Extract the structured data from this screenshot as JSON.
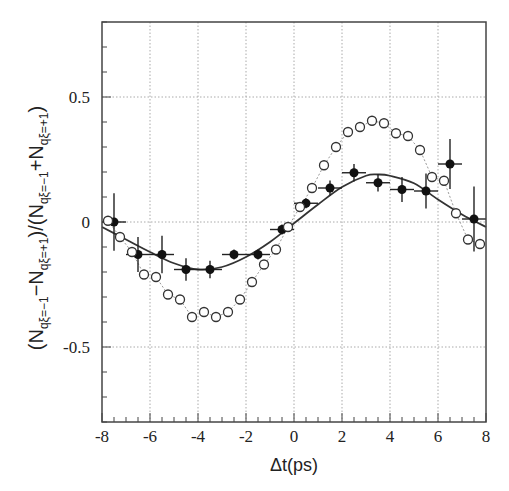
{
  "chart_data": {
    "type": "scatter",
    "title": "",
    "xlabel": "Δt(ps)",
    "ylabel": {
      "text": "(N_{qξ=−1} − N_{qξ=+1})/(N_{qξ=−1} + N_{qξ=+1})",
      "parts": [
        "(N",
        "qξ=−1",
        "−N",
        "qξ=+1",
        ")/(N",
        "qξ=−1",
        "+N",
        "qξ=+1",
        ")"
      ]
    },
    "xlim": [
      -8,
      8
    ],
    "ylim": [
      -0.8,
      0.8
    ],
    "xticks": [
      -8,
      -6,
      -4,
      -2,
      0,
      2,
      4,
      6,
      8
    ],
    "xtick_labels": [
      "-8",
      "-6",
      "-4",
      "-2",
      "0",
      "2",
      "4",
      "6",
      "8"
    ],
    "yticks": [
      -0.5,
      0,
      0.5
    ],
    "ytick_labels": [
      "-0.5",
      "0",
      "0.5"
    ],
    "grid": {
      "x": [
        -6,
        -4,
        -2,
        0,
        2,
        4,
        6
      ],
      "y": [
        -0.5,
        0,
        0.5
      ],
      "style": "dotted"
    },
    "legend": null,
    "series": [
      {
        "name": "data (filled)",
        "marker": "filled-circle",
        "color": "#111111",
        "x": [
          -7.5,
          -6.5,
          -5.5,
          -4.5,
          -3.5,
          -2.5,
          -1.5,
          -0.5,
          0.5,
          1.5,
          2.5,
          3.5,
          4.5,
          5.5,
          6.5,
          7.5
        ],
        "y": [
          0.0,
          -0.13,
          -0.13,
          -0.19,
          -0.19,
          -0.13,
          -0.13,
          -0.03,
          0.075,
          0.136,
          0.197,
          0.157,
          0.13,
          0.124,
          0.232,
          0.012
        ],
        "xerr": 0.5,
        "yerr": [
          0.115,
          0.07,
          0.075,
          0.045,
          0.035,
          0.02,
          0.02,
          0.02,
          0.02,
          0.03,
          0.035,
          0.035,
          0.05,
          0.07,
          0.1,
          0.13
        ]
      },
      {
        "name": "MC (open)",
        "marker": "open-circle",
        "color": "#333333",
        "x": [
          -7.75,
          -7.25,
          -6.75,
          -6.25,
          -5.75,
          -5.25,
          -4.75,
          -4.25,
          -3.75,
          -3.25,
          -2.75,
          -2.25,
          -1.75,
          -1.25,
          -0.75,
          -0.25,
          0.25,
          0.75,
          1.25,
          1.75,
          2.25,
          2.75,
          3.25,
          3.75,
          4.25,
          4.75,
          5.25,
          5.75,
          6.25,
          6.75,
          7.25,
          7.75
        ],
        "y": [
          0.005,
          -0.06,
          -0.12,
          -0.21,
          -0.22,
          -0.29,
          -0.31,
          -0.38,
          -0.36,
          -0.38,
          -0.36,
          -0.31,
          -0.24,
          -0.17,
          -0.11,
          -0.02,
          0.06,
          0.136,
          0.227,
          0.3,
          0.36,
          0.38,
          0.405,
          0.395,
          0.355,
          0.344,
          0.288,
          0.18,
          0.165,
          0.035,
          -0.07,
          -0.088
        ]
      },
      {
        "name": "fit (solid)",
        "type": "line",
        "color": "#333333",
        "x": [
          -8,
          -7,
          -6,
          -5,
          -4,
          -3,
          -2,
          -1,
          0,
          1,
          2,
          3,
          3.5,
          4,
          5,
          6,
          7,
          8
        ],
        "y": [
          -0.02,
          -0.07,
          -0.12,
          -0.165,
          -0.19,
          -0.18,
          -0.14,
          -0.08,
          -0.005,
          0.07,
          0.14,
          0.185,
          0.19,
          0.185,
          0.155,
          0.09,
          0.03,
          -0.02
        ]
      }
    ]
  }
}
